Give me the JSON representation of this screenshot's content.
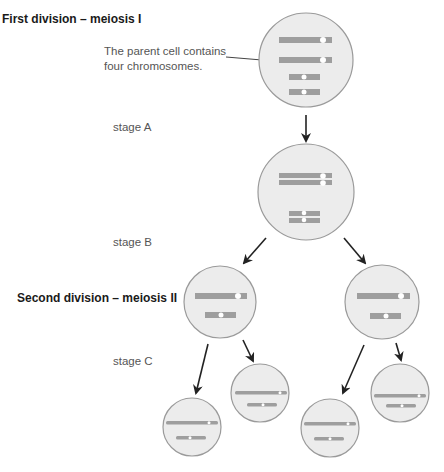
{
  "headings": {
    "first": "First division – meiosis I",
    "second": "Second division – meiosis II"
  },
  "note": {
    "line1": "The parent cell contains",
    "line2": "four chromosomes."
  },
  "stages": {
    "a": "stage A",
    "b": "stage B",
    "c": "stage C"
  },
  "colors": {
    "cell_fill": "#ececec",
    "cell_stroke": "#9a9a9a",
    "chromosome": "#9e9e9e",
    "centromere": "#ffffff",
    "arrow": "#222222"
  }
}
